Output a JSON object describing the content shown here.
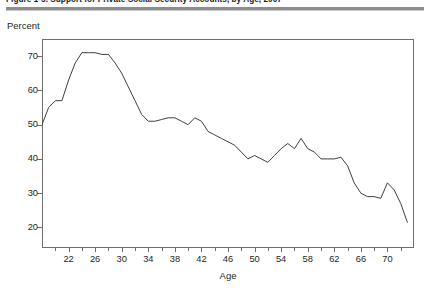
{
  "figure": {
    "title": "Figure 1-5.  Support for Private Social Security Accounts, by Age, 2007",
    "percent_label": "Percent",
    "x_axis_title": "Age"
  },
  "chart_data": {
    "type": "line",
    "title": "Figure 1-5.  Support for Private Social Security Accounts, by Age, 2007",
    "xlabel": "Age",
    "ylabel": "Percent",
    "xlim": [
      18,
      74
    ],
    "ylim": [
      14,
      75
    ],
    "grid": false,
    "legend": null,
    "y_ticks": [
      20,
      30,
      40,
      50,
      60,
      70
    ],
    "x_ticks": [
      22,
      26,
      30,
      34,
      38,
      42,
      46,
      50,
      54,
      58,
      62,
      66,
      70
    ],
    "x_minor_ticks": [
      20,
      24,
      28,
      32,
      36,
      40,
      44,
      48,
      52,
      56,
      60,
      64,
      68,
      72
    ],
    "series": [
      {
        "name": "Support for private Social Security accounts",
        "x": [
          18,
          19,
          20,
          21,
          22,
          23,
          24,
          25,
          26,
          27,
          28,
          29,
          30,
          31,
          32,
          33,
          34,
          35,
          36,
          37,
          38,
          39,
          40,
          41,
          42,
          43,
          44,
          45,
          46,
          47,
          48,
          49,
          50,
          51,
          52,
          53,
          54,
          55,
          56,
          57,
          58,
          59,
          60,
          61,
          62,
          63,
          64,
          65,
          66,
          67,
          68,
          69,
          70,
          71,
          72,
          73
        ],
        "values": [
          50,
          55,
          57,
          57,
          63,
          68,
          71,
          71,
          71,
          70.5,
          70.5,
          68,
          65,
          61,
          57,
          53,
          51,
          51,
          51.5,
          52,
          52,
          51,
          50,
          52,
          51,
          48,
          47,
          46,
          45,
          44,
          42,
          40,
          41,
          40,
          39,
          41,
          43,
          44.5,
          43,
          46,
          43,
          42,
          40,
          40,
          40,
          40.5,
          38,
          33,
          30,
          29,
          29,
          28.5,
          33,
          31,
          27,
          21.5
        ]
      }
    ]
  }
}
